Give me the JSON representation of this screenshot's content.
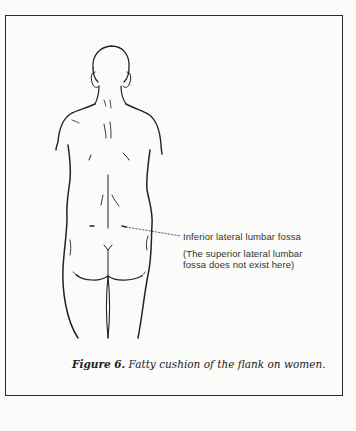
{
  "figure": {
    "annotation": {
      "label": "Inferior lateral lumbar fossa",
      "note_line1": "(The superior lateral lumbar",
      "note_line2": "fossa does not exist here)"
    },
    "caption": {
      "prefix": "Figure 6.",
      "text": " Fatty cushion of the flank on women."
    }
  },
  "colors": {
    "ink": "#222222",
    "paper": "#fbfbf9",
    "frame": "#2a2a2a"
  }
}
